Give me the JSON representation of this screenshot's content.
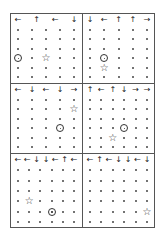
{
  "figure": {
    "panels": [
      {
        "id": "p1",
        "cols": 5,
        "rows": 6,
        "arrows": [
          "←",
          "↑",
          "←",
          "↓"
        ],
        "circle": [
          3,
          0
        ],
        "star": [
          3,
          2
        ]
      },
      {
        "id": "p2",
        "cols": 5,
        "rows": 6,
        "arrows": [
          "↓",
          "←",
          "↑",
          "↑",
          "→"
        ],
        "circle": [
          3,
          1
        ],
        "star": [
          4,
          1
        ]
      },
      {
        "id": "p3",
        "cols": 5,
        "rows": 6,
        "arrows": [
          "←",
          "↓",
          "←",
          "↓",
          "→"
        ],
        "circle": [
          3,
          3
        ],
        "star": [
          1,
          4
        ]
      },
      {
        "id": "p4",
        "cols": 6,
        "rows": 6,
        "arrows": [
          "↑",
          "←",
          "↑",
          "↓",
          "→",
          "→"
        ],
        "circle": [
          3,
          3
        ],
        "star": [
          4,
          2
        ]
      },
      {
        "id": "p5",
        "cols": 6,
        "rows": 6,
        "arrows": [
          "←",
          "←",
          "↓",
          "↓",
          "←",
          "↑",
          "←"
        ],
        "circle": [
          4,
          3
        ],
        "star": [
          3,
          1
        ]
      },
      {
        "id": "p6",
        "cols": 6,
        "rows": 6,
        "arrows": [
          "←",
          "↑",
          "←",
          "↓",
          "↓",
          "←",
          "↓"
        ],
        "circle": [
          6,
          2
        ],
        "star": [
          4,
          5
        ]
      }
    ],
    "symbols": {
      "agent": "circle-dot",
      "goal": "star",
      "empty": "dot"
    }
  }
}
